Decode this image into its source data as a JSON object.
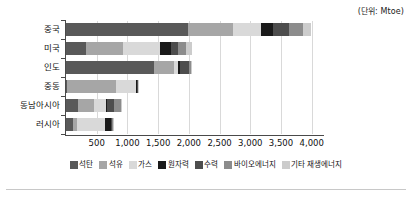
{
  "unit_note": "(단위: Mtoe)",
  "chart_data": {
    "type": "bar",
    "orientation": "horizontal",
    "stacked": true,
    "title": "",
    "subtitle": "",
    "xlabel": "",
    "ylabel": "",
    "unit": "Mtoe",
    "unit_note": "(단위: Mtoe)",
    "grid": true,
    "legend_position": "bottom",
    "xlim": [
      0,
      4200
    ],
    "xticks": [
      500,
      1000,
      1500,
      2000,
      2500,
      3000,
      3500,
      4000
    ],
    "xtick_labels": [
      "500",
      "1,000",
      "1,500",
      "2,000",
      "2,500",
      "3,000",
      "3,500",
      "4,000"
    ],
    "categories": [
      "중국",
      "미국",
      "인도",
      "중동",
      "동남아시아",
      "러시아"
    ],
    "series": [
      {
        "name": "석탄",
        "color": "#595959",
        "values": [
          1990,
          320,
          1440,
          10,
          190,
          120
        ]
      },
      {
        "name": "석유",
        "color": "#a6a6a6",
        "values": [
          730,
          610,
          320,
          800,
          260,
          60
        ]
      },
      {
        "name": "가스",
        "color": "#d9d9d9",
        "values": [
          450,
          600,
          60,
          330,
          200,
          460
        ]
      },
      {
        "name": "원자력",
        "color": "#1a1a1a",
        "values": [
          200,
          180,
          40,
          20,
          10,
          90
        ]
      },
      {
        "name": "수력",
        "color": "#4d4d4d",
        "values": [
          260,
          120,
          150,
          5,
          120,
          20
        ]
      },
      {
        "name": "바이오에너지",
        "color": "#8c8c8c",
        "values": [
          230,
          130,
          30,
          5,
          110,
          10
        ]
      },
      {
        "name": "기타 재생에너지",
        "color": "#cccccc",
        "values": [
          130,
          90,
          20,
          5,
          30,
          5
        ]
      }
    ],
    "totals": [
      3990,
      2050,
      2060,
      1175,
      920,
      765
    ]
  }
}
